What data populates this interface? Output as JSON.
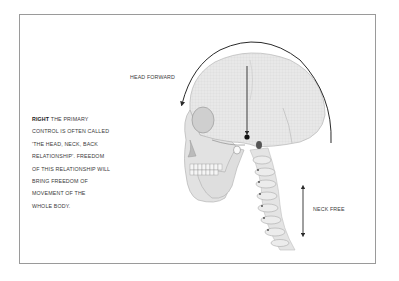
{
  "figure": {
    "caption": {
      "lead": "RIGHT",
      "lines": [
        " THE PRIMARY",
        "CONTROL IS OFTEN CALLED",
        "'THE HEAD, NECK, BACK",
        "RELATIONSHIP'. FREEDOM",
        "OF THIS RELATIONSHIP WILL",
        "BRING FREEDOM OF",
        "MOVEMENT OF THE",
        "WHOLE BODY."
      ]
    },
    "labels": {
      "head_forward": "HEAD FORWARD",
      "neck_free": "NECK FREE"
    },
    "illustration": "skull-and-cervical-spine",
    "colors": {
      "frame": "#9a9a9a",
      "arrow": "#2a2a2a",
      "bone": "#e6e6e6",
      "bone_shade": "#c9c9c9"
    }
  }
}
